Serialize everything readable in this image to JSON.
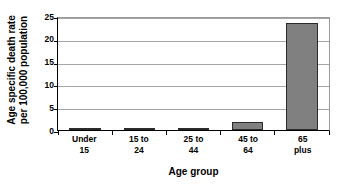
{
  "chart_data": {
    "type": "bar",
    "title": "",
    "subtitle": "",
    "xlabel": "Age group",
    "ylabel": "Age specific death rate per 100,000 population",
    "ylabel_line1": "Age specific death rate",
    "ylabel_line2": "per 100,000 population",
    "categories": [
      "Under 15",
      "15 to 24",
      "25 to 44",
      "45 to 64",
      "65 plus"
    ],
    "category_lines": [
      {
        "line1": "Under",
        "line2": "15"
      },
      {
        "line1": "15 to",
        "line2": "24"
      },
      {
        "line1": "25 to",
        "line2": "44"
      },
      {
        "line1": "45 to",
        "line2": "64"
      },
      {
        "line1": "65",
        "line2": "plus"
      }
    ],
    "values": [
      0.3,
      0.02,
      0.1,
      1.7,
      23.4
    ],
    "ylim": [
      0,
      25
    ],
    "ytick_values": [
      0,
      5,
      10,
      15,
      20,
      25
    ],
    "ytick_labels": [
      "0",
      "5",
      "10",
      "15",
      "20",
      "25"
    ],
    "grid": true,
    "grid_axis": "y",
    "legend": false,
    "legend_position": "none",
    "bar_fill_color": "#808080",
    "bar_border_color": "#2b2b2b",
    "gridline_color": "#a6a6a6",
    "axis_color": "#000000",
    "background_color": "#ffffff"
  }
}
